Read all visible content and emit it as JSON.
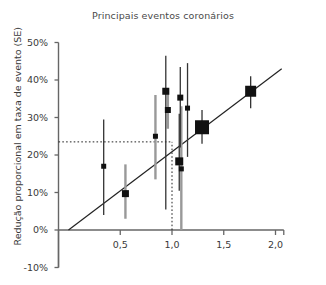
{
  "chart": {
    "title": "Principais eventos coronários",
    "ylabel": "Redução proporcional em taxa de evento (SE)",
    "xlabel": ""
  },
  "axes": {
    "y_ticks": [
      "50%",
      "40%",
      "30%",
      "20%",
      "10%",
      "0%",
      "-10%"
    ],
    "x_ticks": [
      "0,5",
      "1,0",
      "1,5",
      "2,0"
    ]
  },
  "colors": {
    "marker": "#111111",
    "error_black": "#333333",
    "error_gray": "#999999",
    "axis": "#666666",
    "fit_line": "#222222",
    "dotted": "#222222",
    "title_text": "#4a4a4a"
  },
  "chart_data": {
    "type": "scatter",
    "title": "Principais eventos coronários",
    "xlabel": "",
    "ylabel": "Redução proporcional em taxa de evento (SE)",
    "xlim": [
      0.0,
      2.12
    ],
    "ylim": [
      -10,
      50
    ],
    "xticks": [
      0.5,
      1.0,
      1.5,
      2.0
    ],
    "xticklabels": [
      "0,5",
      "1,0",
      "1,5",
      "2,0"
    ],
    "yticks": [
      -10,
      0,
      10,
      20,
      30,
      40,
      50
    ],
    "yticklabels": [
      "-10%",
      "0%",
      "10%",
      "20%",
      "30%",
      "40%",
      "50%"
    ],
    "grid": false,
    "legend": null,
    "reference_lines": [
      {
        "kind": "hline",
        "y": 23.5,
        "style": "dotted",
        "x_from": 0.0,
        "x_to": 1.0
      },
      {
        "kind": "vline",
        "x": 1.0,
        "style": "dotted",
        "y_from": 0.0,
        "y_to": 23.5
      },
      {
        "kind": "fit",
        "style": "solid",
        "x_from": 0.0,
        "y_from": 0.0,
        "x_to": 2.06,
        "y_to": 43.0
      }
    ],
    "points": [
      {
        "x": 0.34,
        "y": 17.0,
        "ylow": 4.0,
        "yhigh": 29.5,
        "size": 5,
        "errcolor": "#333333"
      },
      {
        "x": 0.55,
        "y": 9.7,
        "ylow": 3.0,
        "yhigh": 17.5,
        "size": 7,
        "errcolor": "#999999"
      },
      {
        "x": 0.84,
        "y": 25.0,
        "ylow": 13.5,
        "yhigh": 36.0,
        "size": 5,
        "errcolor": "#999999"
      },
      {
        "x": 0.94,
        "y": 37.0,
        "ylow": 5.5,
        "yhigh": 46.5,
        "size": 7,
        "errcolor": "#333333"
      },
      {
        "x": 0.96,
        "y": 32.0,
        "ylow": 27.0,
        "yhigh": 37.5,
        "size": 6,
        "errcolor": "#999999"
      },
      {
        "x": 1.07,
        "y": 18.3,
        "ylow": 10.5,
        "yhigh": 31.0,
        "size": 8,
        "errcolor": "#333333"
      },
      {
        "x": 1.08,
        "y": 35.3,
        "ylow": 22.0,
        "yhigh": 43.5,
        "size": 6,
        "errcolor": "#333333"
      },
      {
        "x": 1.09,
        "y": 16.3,
        "ylow": 0.0,
        "yhigh": 33.0,
        "size": 5,
        "errcolor": "#999999"
      },
      {
        "x": 1.15,
        "y": 32.5,
        "ylow": 19.5,
        "yhigh": 44.5,
        "size": 5,
        "errcolor": "#333333"
      },
      {
        "x": 1.29,
        "y": 27.4,
        "ylow": 23.0,
        "yhigh": 32.0,
        "size": 14,
        "errcolor": "#333333"
      },
      {
        "x": 1.76,
        "y": 37.0,
        "ylow": 32.5,
        "yhigh": 41.0,
        "size": 11,
        "errcolor": "#333333"
      }
    ]
  }
}
